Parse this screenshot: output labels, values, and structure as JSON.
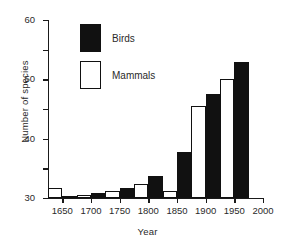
{
  "chart_data": {
    "type": "bar",
    "title": "",
    "xlabel": "Year",
    "ylabel": "Number of species",
    "xlim": [
      1625,
      2000
    ],
    "ylim": [
      0,
      60
    ],
    "grid": false,
    "legend_position": "upper-left-inside",
    "xticks": [
      1650,
      1700,
      1750,
      1800,
      1850,
      1900,
      1950,
      2000
    ],
    "yticks": [
      0,
      10,
      20,
      30,
      40,
      50,
      60
    ],
    "bin_width": 25,
    "series": [
      {
        "name": "Mammals",
        "color": "#ffffff",
        "bins": [
          1625,
          1675,
          1725,
          1775,
          1825,
          1875,
          1925
        ],
        "values": [
          3.5,
          1,
          2.5,
          4.7,
          2.5,
          31,
          40
        ]
      },
      {
        "name": "Birds",
        "color": "#111111",
        "bins": [
          1650,
          1700,
          1750,
          1800,
          1850,
          1900,
          1950
        ],
        "values": [
          0.3,
          1.8,
          3.5,
          7.5,
          15.5,
          35,
          46
        ]
      }
    ],
    "bars": [
      {
        "bin_start": 1625,
        "series": "Mammals",
        "value": 3.5
      },
      {
        "bin_start": 1650,
        "series": "Birds",
        "value": 0.3
      },
      {
        "bin_start": 1675,
        "series": "Mammals",
        "value": 1.0
      },
      {
        "bin_start": 1700,
        "series": "Birds",
        "value": 1.8
      },
      {
        "bin_start": 1725,
        "series": "Mammals",
        "value": 2.5
      },
      {
        "bin_start": 1750,
        "series": "Birds",
        "value": 3.5
      },
      {
        "bin_start": 1775,
        "series": "Mammals",
        "value": 4.7
      },
      {
        "bin_start": 1800,
        "series": "Birds",
        "value": 7.5
      },
      {
        "bin_start": 1825,
        "series": "Mammals",
        "value": 2.5
      },
      {
        "bin_start": 1850,
        "series": "Birds",
        "value": 15.5
      },
      {
        "bin_start": 1875,
        "series": "Mammals",
        "value": 31.0
      },
      {
        "bin_start": 1900,
        "series": "Birds",
        "value": 35.0
      },
      {
        "bin_start": 1925,
        "series": "Mammals",
        "value": 40.0
      },
      {
        "bin_start": 1950,
        "series": "Birds",
        "value": 46.0
      }
    ]
  },
  "axes": {
    "ylabel": "Number of species",
    "xlabel": "Year",
    "ytick_labels": [
      "0",
      "10",
      "20",
      "30",
      "40",
      "50",
      "60"
    ],
    "xtick_labels": [
      "1650",
      "1700",
      "1750",
      "1800",
      "1850",
      "1900",
      "1950",
      "2000"
    ]
  },
  "legend": {
    "items": [
      {
        "label": "Birds",
        "swatch": "filled-black"
      },
      {
        "label": "Mammals",
        "swatch": "outlined-white"
      }
    ]
  }
}
